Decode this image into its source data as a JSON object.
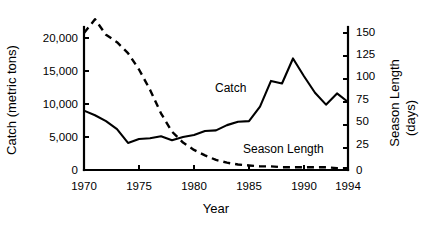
{
  "chart_data": {
    "type": "line",
    "title": "",
    "xlabel": "Year",
    "ylabel": "Catch (metric tons)",
    "y2label_line1": "Season Length",
    "y2label_line2": "(days)",
    "xlim": [
      1970,
      1994
    ],
    "ylim": [
      0,
      21500
    ],
    "y2lim": [
      0,
      161
    ],
    "grid": false,
    "legend_position": "inline-annotations",
    "x_ticks": [
      1970,
      1975,
      1980,
      1985,
      1990,
      1994
    ],
    "x_tick_labels": [
      "1970",
      "1975",
      "1980",
      "1985",
      "1990",
      "1994"
    ],
    "y_ticks": [
      0,
      5000,
      10000,
      15000,
      20000
    ],
    "y_tick_labels": [
      "0",
      "5,000",
      "10,000",
      "15,000",
      "20,000"
    ],
    "y2_ticks": [
      0,
      25,
      50,
      75,
      100,
      125,
      150
    ],
    "y2_tick_labels": [
      "0",
      "25",
      "50",
      "75",
      "100",
      "125",
      "150"
    ],
    "x": [
      1970,
      1971,
      1972,
      1973,
      1974,
      1975,
      1976,
      1977,
      1978,
      1979,
      1980,
      1981,
      1982,
      1983,
      1984,
      1985,
      1986,
      1987,
      1988,
      1989,
      1990,
      1991,
      1992,
      1993,
      1994
    ],
    "series": [
      {
        "name": "Catch",
        "axis": "left",
        "style": "solid",
        "units": "metric tons",
        "values": [
          9000,
          8300,
          7400,
          6200,
          4100,
          4700,
          4800,
          5100,
          4500,
          5000,
          5300,
          5900,
          6000,
          6800,
          7300,
          7400,
          9600,
          13500,
          13100,
          16900,
          14200,
          11700,
          9900,
          11600,
          10300
        ]
      },
      {
        "name": "Season Length",
        "axis": "right",
        "style": "dashed",
        "units": "days",
        "values": [
          150,
          165,
          148,
          140,
          128,
          110,
          88,
          62,
          42,
          30,
          22,
          16,
          11,
          8,
          6,
          5,
          4,
          4,
          3,
          3,
          3,
          3,
          3,
          2,
          2
        ]
      }
    ],
    "annotations": [
      {
        "text": "Catch",
        "x": 1983.2,
        "y_pixel": 88
      },
      {
        "text": "Season Length",
        "x": 1985.6,
        "y_pixel": 149
      }
    ]
  }
}
